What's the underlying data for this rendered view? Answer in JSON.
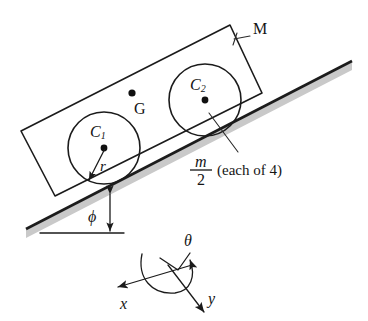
{
  "figure": {
    "name": "cart-on-incline-free-body-diagram",
    "background_color": "#ffffff",
    "ink_color": "#1b1b1b",
    "incline_shadow_color": "#c9c9c9"
  },
  "labels": {
    "body_mass": "M",
    "center_of_gravity": "G",
    "wheel_1": "C",
    "wheel_1_sub": "1",
    "wheel_2": "C",
    "wheel_2_sub": "2",
    "radius": "r",
    "incline_angle": "ϕ",
    "wheel_mass_numerator": "m",
    "wheel_mass_denominator": "2",
    "wheel_mass_note": "(each of 4)",
    "axis_x": "x",
    "axis_y": "y",
    "axis_theta": "θ"
  },
  "geometry": {
    "incline_angle_degrees": 21,
    "wheel_count": 4,
    "wheel_radius_px": 36,
    "wheel_1_center": [
      104,
      148
    ],
    "wheel_2_center": [
      205,
      100
    ],
    "center_of_gravity_point": [
      132,
      94
    ],
    "axes_origin": [
      178,
      278
    ]
  },
  "icons": {
    "radius_arrow": "arrow-icon",
    "angle_arrow": "double-arrow-icon",
    "theta_arc_arrow": "curved-arrow-icon",
    "x_axis_arrow": "arrow-icon",
    "y_axis_arrow": "arrow-icon",
    "leader_line_m": "leader-line-icon",
    "leader_line_M": "leader-line-icon"
  }
}
